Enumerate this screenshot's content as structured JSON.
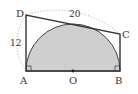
{
  "diagram": {
    "type": "geometry",
    "points": {
      "A": {
        "label": "A",
        "x": 26,
        "y": 71
      },
      "B": {
        "label": "B",
        "x": 120,
        "y": 71
      },
      "C": {
        "label": "C",
        "x": 120,
        "y": 34
      },
      "D": {
        "label": "D",
        "x": 26,
        "y": 15
      },
      "O": {
        "label": "O",
        "x": 73,
        "y": 71
      }
    },
    "measurements": {
      "AD": "12",
      "DC": "20"
    },
    "colors": {
      "stroke": "#333333",
      "fill": "#cccccc",
      "dotted": "#999999"
    }
  }
}
